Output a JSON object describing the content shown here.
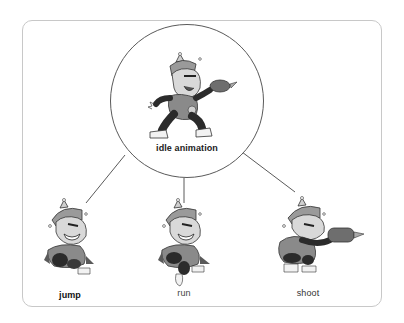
{
  "diagram": {
    "root": {
      "label": "idle animation",
      "icon": "character-idle-sprite"
    },
    "children": [
      {
        "label": "jump",
        "icon": "character-jump-sprite"
      },
      {
        "label": "run",
        "icon": "character-run-sprite"
      },
      {
        "label": "shoot",
        "icon": "character-shoot-sprite"
      }
    ],
    "edges": [
      {
        "from": "idle animation",
        "to": "jump"
      },
      {
        "from": "idle animation",
        "to": "run"
      },
      {
        "from": "idle animation",
        "to": "shoot"
      }
    ],
    "colors": {
      "frame_border": "#c8c8c8",
      "circle_border": "#5a5a5a",
      "connector": "#5a5a5a",
      "sprite_dark": "#2b2b2b",
      "sprite_mid": "#8a8a8a",
      "sprite_light": "#cfcfcf"
    }
  }
}
